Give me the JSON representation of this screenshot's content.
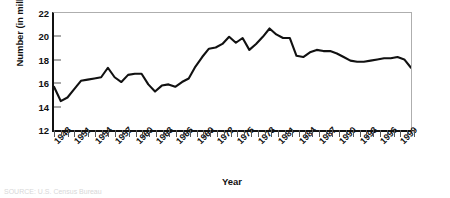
{
  "chart_data": {
    "type": "line",
    "title": "",
    "xlabel": "Year",
    "ylabel": "Number (in millions)",
    "xlim": [
      1948,
      2001
    ],
    "ylim": [
      12,
      22
    ],
    "ytick_values": [
      12,
      14,
      16,
      18,
      20,
      22
    ],
    "ytick_labels": [
      "12",
      "14",
      "16",
      "18",
      "20",
      "22"
    ],
    "xtick_labels": [
      "1948",
      "1951",
      "1954",
      "1957",
      "1960",
      "1963",
      "1966",
      "1969",
      "1972",
      "1975",
      "1978",
      "1981",
      "1984",
      "1987",
      "1990",
      "1993",
      "1996",
      "1999"
    ],
    "xtick_step": 3,
    "xtick_minor_step": 1,
    "grid": false,
    "legend": null,
    "line_color": "#111111",
    "x": [
      1948,
      1949,
      1950,
      1951,
      1952,
      1953,
      1954,
      1955,
      1956,
      1957,
      1958,
      1959,
      1960,
      1961,
      1962,
      1963,
      1964,
      1965,
      1966,
      1967,
      1968,
      1969,
      1970,
      1971,
      1972,
      1973,
      1974,
      1975,
      1976,
      1977,
      1978,
      1979,
      1980,
      1981,
      1982,
      1983,
      1984,
      1985,
      1986,
      1987,
      1988,
      1989,
      1990,
      1991,
      1992,
      1993,
      1994,
      1995,
      1996,
      1997,
      1998,
      1999,
      2000,
      2001
    ],
    "values": [
      15.8,
      14.6,
      14.9,
      15.6,
      16.3,
      16.4,
      16.5,
      16.6,
      17.4,
      16.6,
      16.2,
      16.8,
      16.9,
      16.9,
      16.0,
      15.4,
      15.9,
      16.0,
      15.8,
      16.2,
      16.5,
      17.5,
      18.3,
      19.0,
      19.1,
      19.4,
      20.0,
      19.5,
      19.9,
      18.9,
      19.4,
      20.0,
      20.7,
      20.2,
      19.9,
      19.9,
      18.4,
      18.3,
      18.7,
      18.9,
      18.8,
      18.8,
      18.6,
      18.3,
      18.0,
      17.9,
      17.9,
      18.0,
      18.1,
      18.2,
      18.2,
      18.3,
      18.1,
      17.4
    ]
  },
  "footnote": "SOURCE: U.S. Census Bureau"
}
